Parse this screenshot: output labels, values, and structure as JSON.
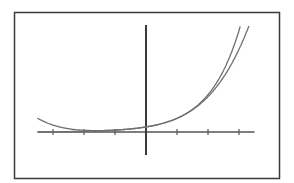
{
  "chart_data": {
    "type": "line",
    "title": "",
    "xlabel": "",
    "ylabel": "",
    "xlim": [
      -3.5,
      3.5
    ],
    "ylim": [
      -4,
      22
    ],
    "grid": false,
    "legend": null,
    "x_ticks": [
      -3,
      -2,
      -1,
      1,
      2,
      3
    ],
    "series": [
      {
        "name": "exponential",
        "description": "y = e^x",
        "x": [
          -3.5,
          -3,
          -2.5,
          -2,
          -1.5,
          -1,
          -0.5,
          0,
          0.5,
          1,
          1.5,
          2,
          2.5,
          3,
          3.15
        ],
        "y": [
          0.03,
          0.05,
          0.08,
          0.14,
          0.22,
          0.37,
          0.61,
          1,
          1.65,
          2.72,
          4.48,
          7.39,
          12.18,
          20.09,
          23.3
        ]
      },
      {
        "name": "polynomial-approximation",
        "description": "Taylor polynomial approximation of e^x",
        "x": [
          -3.5,
          -3,
          -2.5,
          -2,
          -1.5,
          -1,
          -0.5,
          0,
          0.5,
          1,
          1.5,
          2,
          2.5,
          3,
          3.3
        ],
        "y": [
          -1.5,
          -0.8,
          -0.3,
          0.0,
          0.15,
          0.36,
          0.61,
          1,
          1.65,
          2.71,
          4.45,
          7.27,
          11.7,
          18.4,
          23.3
        ]
      }
    ]
  },
  "colors": {
    "background": "#ffffff",
    "frame": "#3a3a3a",
    "axes": "#555555",
    "curve": "#6e6e6e"
  }
}
